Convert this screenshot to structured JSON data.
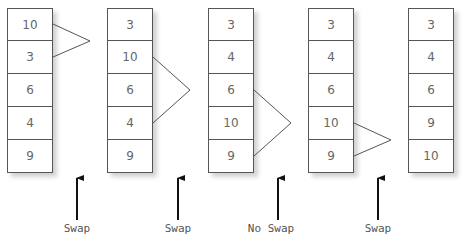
{
  "diagram": {
    "type": "bubble-sort-pass",
    "columns": [
      {
        "values": [
          "10",
          "3",
          "6",
          "4",
          "9"
        ],
        "compare": [
          0,
          1
        ]
      },
      {
        "values": [
          "3",
          "10",
          "6",
          "4",
          "9"
        ],
        "compare": [
          1,
          3
        ]
      },
      {
        "values": [
          "3",
          "4",
          "6",
          "10",
          "9"
        ],
        "compare": [
          2,
          4
        ]
      },
      {
        "values": [
          "3",
          "4",
          "6",
          "10",
          "9"
        ],
        "compare": [
          3,
          4
        ]
      },
      {
        "values": [
          "3",
          "4",
          "6",
          "9",
          "10"
        ],
        "compare": null
      }
    ],
    "steps": [
      {
        "label": "Swap"
      },
      {
        "label": "Swap"
      },
      {
        "label": "No Swap"
      },
      {
        "label": "Swap"
      }
    ]
  }
}
